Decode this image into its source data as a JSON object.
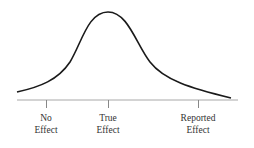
{
  "diagram": {
    "type": "bell_curve",
    "colors": {
      "curve": "#1a1a1a",
      "axis": "#9a9a9a",
      "text": "#333333"
    },
    "labels": [
      {
        "line1": "No",
        "line2": "Effect"
      },
      {
        "line1": "True",
        "line2": "Effect"
      },
      {
        "line1": "Reported",
        "line2": "Effect"
      }
    ]
  }
}
